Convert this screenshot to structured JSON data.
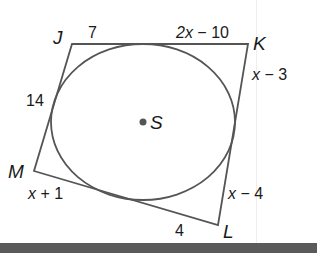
{
  "figure": {
    "type": "circumscribed-quadrilateral",
    "colors": {
      "stroke": "#555555",
      "text": "#1a1a1a",
      "bar": "#5a5a5a"
    },
    "center": {
      "label": "S"
    },
    "vertices": {
      "J": "J",
      "K": "K",
      "L": "L",
      "M": "M"
    },
    "segments": {
      "j_top": "7",
      "k_top_var": "2x",
      "k_top_rest": " − 10",
      "k_right_var": "x",
      "k_right_rest": " − 3",
      "j_left": "14",
      "m_bottom_var": "x",
      "m_bottom_rest": " + 1",
      "l_right_var": "x",
      "l_right_rest": " − 4",
      "l_bottom": "4"
    }
  }
}
